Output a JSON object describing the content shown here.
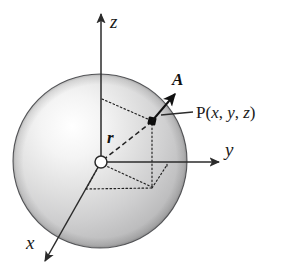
{
  "figure": {
    "background_color": "#ffffff",
    "sphere": {
      "name": "shaded-sphere",
      "center_x": 100,
      "center_y": 161,
      "radius": 87,
      "outline_color": "#55565a",
      "fill_light": "#fbfbfb",
      "fill_mid": "#d3d3d3",
      "fill_dark": "#a9a9ab"
    },
    "axes": [
      {
        "id": "z",
        "label": "z",
        "label_x": 110,
        "label_y": 26,
        "from_x": 101,
        "from_y": 162,
        "to_x": 101,
        "to_y": 12,
        "color": "#2b2b2b"
      },
      {
        "id": "y",
        "label": "y",
        "label_x": 229,
        "label_y": 156,
        "from_x": 101,
        "from_y": 162,
        "to_x": 221,
        "to_y": 162,
        "color": "#2b2b2b"
      },
      {
        "id": "x",
        "label": "x",
        "label_x": 28,
        "label_y": 248,
        "from_x": 101,
        "from_y": 162,
        "to_x": 44,
        "to_y": 263,
        "color": "#2b2b2b"
      }
    ],
    "origin": {
      "name": "origin-marker",
      "x": 101,
      "y": 162,
      "radius": 6,
      "fill": "#ffffff",
      "stroke": "#2b2b2b"
    },
    "point_p": {
      "name": "point-p-marker",
      "x": 152,
      "y": 121,
      "size": 7,
      "fill": "#0d0d0d",
      "label_prefix": "P(",
      "label_x": "x",
      "label_sep1": ", ",
      "label_y": "y",
      "label_sep2": ", ",
      "label_z": "z",
      "label_suffix": ")",
      "label_text": "P(x, y, z)",
      "label_pos_x": 196,
      "label_pos_y": 117
    },
    "leader_line": {
      "name": "point-label-leader",
      "from_x": 160,
      "from_y": 115,
      "to_x": 192,
      "to_y": 112,
      "color": "#2b2b2b"
    },
    "vector_a": {
      "name": "vector-a",
      "label": "A",
      "label_x": 176,
      "label_y": 84,
      "from_x": 152,
      "from_y": 121,
      "to_x": 177,
      "to_y": 92,
      "color": "#111111"
    },
    "vector_r": {
      "name": "vector-r",
      "label": "r",
      "label_x": 110,
      "label_y": 141,
      "from_x": 101,
      "from_y": 162,
      "to_x": 150,
      "to_y": 124,
      "color": "#222222",
      "style": "dashed"
    },
    "construction_lines": {
      "name": "projection-box",
      "color": "#1f1f1f",
      "style": "dotted",
      "segments": [
        {
          "name": "z-to-p",
          "x1": 102,
          "y1": 99,
          "x2": 150,
          "y2": 120
        },
        {
          "name": "p-vertical-drop",
          "x1": 152,
          "y1": 123,
          "x2": 152,
          "y2": 187
        },
        {
          "name": "base-front-left",
          "x1": 86,
          "y1": 189,
          "x2": 152,
          "y2": 188
        },
        {
          "name": "base-left-up",
          "x1": 86,
          "y1": 189,
          "x2": 101,
          "y2": 163
        },
        {
          "name": "origin-to-corner",
          "x1": 103,
          "y1": 164,
          "x2": 152,
          "y2": 187
        },
        {
          "name": "base-right-edge",
          "x1": 152,
          "y1": 188,
          "x2": 167,
          "y2": 166
        },
        {
          "name": "y-axis-foot",
          "x1": 167,
          "y1": 166,
          "x2": 167,
          "y2": 163
        }
      ]
    }
  }
}
